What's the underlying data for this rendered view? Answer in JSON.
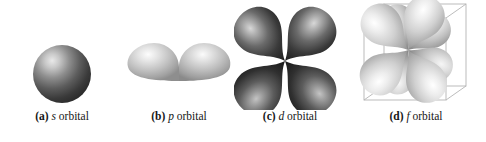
{
  "figure": {
    "background_color": "#ffffff",
    "width": 486,
    "height": 142
  },
  "panels": [
    {
      "id": "s-orbital",
      "tag": "(a)",
      "symbol": "s",
      "word": "orbital",
      "shape": "sphere",
      "lobe_count": 1,
      "fill_light": "#d8d8d8",
      "fill_dark": "#2a2a2a",
      "has_cube": false
    },
    {
      "id": "p-orbital",
      "tag": "(b)",
      "symbol": "p",
      "word": "orbital",
      "shape": "two-teardrop-lobes",
      "lobe_count": 2,
      "fill_light": "#f2f2f2",
      "fill_dark": "#9a9a9a",
      "has_cube": false
    },
    {
      "id": "d-orbital",
      "tag": "(c)",
      "symbol": "d",
      "word": "orbital",
      "shape": "four-lobe-cloverleaf",
      "lobe_count": 4,
      "fill_light": "#cfcfcf",
      "fill_dark": "#1c1c1c",
      "has_cube": false
    },
    {
      "id": "f-orbital",
      "tag": "(d)",
      "symbol": "f",
      "word": "orbital",
      "shape": "eight-lobe-cubic",
      "lobe_count": 8,
      "fill_light": "#fbfbfb",
      "fill_dark": "#8e8e8e",
      "has_cube": true,
      "cube_line_color": "#b4b4b4"
    }
  ]
}
